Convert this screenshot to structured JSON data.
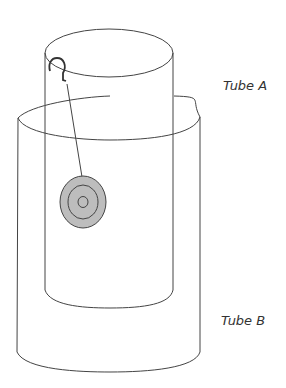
{
  "diagram": {
    "labels": {
      "tube_a": "Tube A",
      "tube_b": "Tube B"
    },
    "colors": {
      "line": "#444444",
      "disk_fill": "#bdbdbd",
      "background": "#ffffff",
      "text": "#333333"
    },
    "components": [
      "tube-a",
      "tube-b",
      "hook",
      "string",
      "disk"
    ]
  }
}
